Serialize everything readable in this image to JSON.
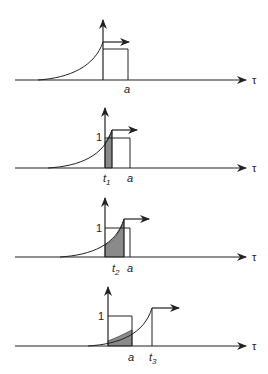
{
  "diagram": {
    "axis_label": "τ",
    "colors": {
      "line": "#222222",
      "fill": "#8a8a8a",
      "background": "#ffffff"
    },
    "panels": [
      {
        "id": "panel-1",
        "pulse_label": "a",
        "time_label": "",
        "time_sub": "",
        "height_label": "",
        "shaded": false
      },
      {
        "id": "panel-2",
        "pulse_label": "a",
        "time_label": "t",
        "time_sub": "1",
        "height_label": "1",
        "shaded": true
      },
      {
        "id": "panel-3",
        "pulse_label": "a",
        "time_label": "t",
        "time_sub": "2",
        "height_label": "1",
        "shaded": true
      },
      {
        "id": "panel-4",
        "pulse_label": "a",
        "time_label": "t",
        "time_sub": "3",
        "height_label": "1",
        "shaded": true
      }
    ]
  }
}
